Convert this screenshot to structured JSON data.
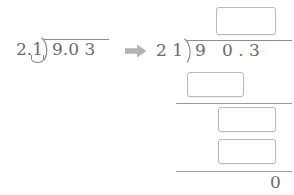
{
  "worksheet": {
    "type": "long-division-decimal-worksheet",
    "transform_icon": "right-arrow-icon",
    "transform_icon_color": "#b0b0b0",
    "ink_color": "#6b6b6b",
    "box_border_color": "#b9b9b9",
    "rule_color": "#9a9a9a"
  },
  "original_problem": {
    "label": "original-division",
    "divisor": "2.1",
    "dividend": "9.0 3",
    "divisor_shift_mark": "decimal-shift-arc",
    "bracket_icon": "division-bracket-icon"
  },
  "converted_problem": {
    "label": "converted-division",
    "divisor": "2 1",
    "dividend": "9   0 . 3",
    "bracket_icon": "division-bracket-icon",
    "quotient_box": "",
    "quotient_box_placeholder": "",
    "work_rows": [
      {
        "name": "subtract-row-1",
        "value": ""
      },
      {
        "name": "subtract-row-2",
        "value": ""
      },
      {
        "name": "subtract-row-3",
        "value": ""
      }
    ],
    "remainder": "0"
  }
}
